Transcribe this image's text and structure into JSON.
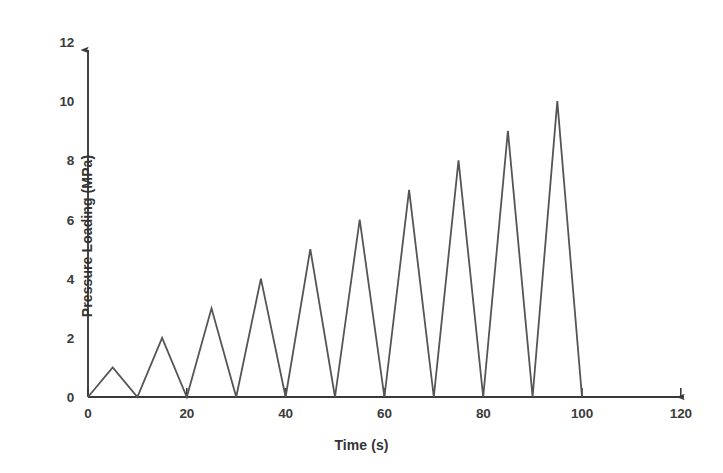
{
  "chart_data": {
    "type": "line",
    "title": "",
    "xlabel": "Time (s)",
    "ylabel": "Pressure Loading (MPa)",
    "xlim": [
      0,
      120
    ],
    "ylim": [
      0,
      12
    ],
    "xticks": [
      0,
      20,
      40,
      60,
      80,
      100,
      120
    ],
    "yticks": [
      0,
      2,
      4,
      6,
      8,
      10,
      12
    ],
    "xtick_labels": [
      "0",
      "20",
      "40",
      "60",
      "80",
      "100",
      "120"
    ],
    "ytick_labels": [
      "0",
      "2",
      "4",
      "6",
      "8",
      "10",
      "12"
    ],
    "grid": false,
    "legend": null,
    "series": [
      {
        "name": "Pressure Loading",
        "color": "#555555",
        "line_width": 1.8,
        "x": [
          0,
          5,
          10,
          15,
          20,
          25,
          30,
          35,
          40,
          45,
          50,
          55,
          60,
          65,
          70,
          75,
          80,
          85,
          90,
          95,
          100
        ],
        "y": [
          0,
          1,
          0,
          2,
          0,
          3,
          0,
          4,
          0,
          5,
          0,
          6,
          0,
          7,
          0,
          8,
          0,
          9,
          0,
          10,
          0
        ]
      }
    ],
    "peaks": [
      {
        "time": 5,
        "pressure": 1
      },
      {
        "time": 15,
        "pressure": 2
      },
      {
        "time": 25,
        "pressure": 3
      },
      {
        "time": 35,
        "pressure": 4
      },
      {
        "time": 45,
        "pressure": 5
      },
      {
        "time": 55,
        "pressure": 6
      },
      {
        "time": 65,
        "pressure": 7
      },
      {
        "time": 75,
        "pressure": 8
      },
      {
        "time": 85,
        "pressure": 9
      },
      {
        "time": 95,
        "pressure": 10
      }
    ],
    "axis_style": {
      "x_axis_arrow": true,
      "y_axis_arrow": true,
      "x_tick_marks": true,
      "y_tick_marks": false,
      "axis_color": "#444444",
      "background": "#ffffff"
    }
  }
}
